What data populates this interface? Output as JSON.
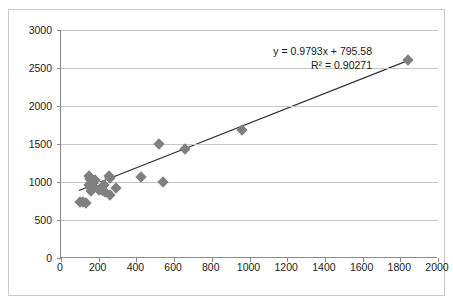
{
  "chart_data": {
    "type": "scatter",
    "title": "",
    "xlabel": "",
    "ylabel": "",
    "xlim": [
      0,
      2000
    ],
    "ylim": [
      0,
      3000
    ],
    "xticks": [
      0,
      200,
      400,
      600,
      800,
      1000,
      1200,
      1400,
      1600,
      1800,
      2000
    ],
    "yticks": [
      0,
      500,
      1000,
      1500,
      2000,
      2500,
      3000
    ],
    "xtick_labels": [
      "0",
      "200",
      "400",
      "600",
      "800",
      "1000",
      "1200",
      "1400",
      "1600",
      "1800",
      "2000"
    ],
    "ytick_labels": [
      "0",
      "500",
      "1000",
      "1500",
      "2000",
      "2500",
      "3000"
    ],
    "grid": "horizontal",
    "legend": "none",
    "marker_shape": "diamond",
    "marker_color": "#808080",
    "trendline_color": "#333333",
    "gridline_color": "#c6c6c6",
    "axis_color": "#8a8a8a",
    "points": [
      {
        "x": 100,
        "y": 740
      },
      {
        "x": 118,
        "y": 735
      },
      {
        "x": 135,
        "y": 718
      },
      {
        "x": 150,
        "y": 1085
      },
      {
        "x": 152,
        "y": 1040
      },
      {
        "x": 150,
        "y": 960
      },
      {
        "x": 158,
        "y": 925
      },
      {
        "x": 160,
        "y": 880
      },
      {
        "x": 175,
        "y": 930
      },
      {
        "x": 180,
        "y": 1020
      },
      {
        "x": 200,
        "y": 900
      },
      {
        "x": 215,
        "y": 890
      },
      {
        "x": 228,
        "y": 955
      },
      {
        "x": 235,
        "y": 870
      },
      {
        "x": 255,
        "y": 1085
      },
      {
        "x": 258,
        "y": 1050
      },
      {
        "x": 262,
        "y": 830
      },
      {
        "x": 290,
        "y": 920
      },
      {
        "x": 425,
        "y": 1060
      },
      {
        "x": 522,
        "y": 1500
      },
      {
        "x": 540,
        "y": 995
      },
      {
        "x": 660,
        "y": 1430
      },
      {
        "x": 962,
        "y": 1685
      },
      {
        "x": 1840,
        "y": 2600
      }
    ],
    "trendline": {
      "slope": 0.9793,
      "intercept": 795.58,
      "r_squared": 0.90271,
      "x_start": 95,
      "x_end": 1850
    },
    "annotation": {
      "equation": "y = 0.9793x + 795.58",
      "r2": "R² = 0.90271"
    }
  }
}
